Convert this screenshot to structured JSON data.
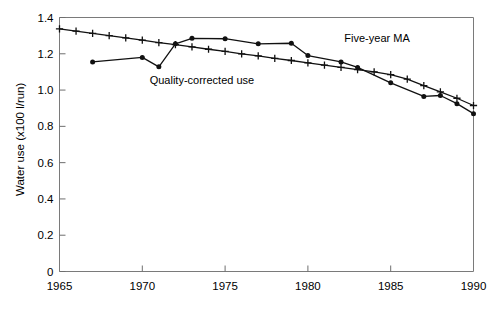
{
  "chart_data": {
    "type": "line",
    "title": "",
    "xlabel": "",
    "ylabel": "Water use (x100 l/run)",
    "xlim": [
      1965,
      1990
    ],
    "ylim": [
      0,
      1.4
    ],
    "grid": false,
    "legend_position": "inline-annotations",
    "x_ticks": [
      "1965",
      "1970",
      "1975",
      "1980",
      "1985",
      "1990"
    ],
    "x_tick_values": [
      1965,
      1970,
      1975,
      1980,
      1985,
      1990
    ],
    "y_ticks": [
      "0",
      "0.2",
      "0.4",
      "0.6",
      "0.8",
      "1.0",
      "1.2",
      "1.4"
    ],
    "y_tick_values": [
      0,
      0.2,
      0.4,
      0.6,
      0.8,
      1.0,
      1.2,
      1.4
    ],
    "annotations": [
      {
        "text": "Five-year MA",
        "x": 1982.2,
        "y": 1.265
      },
      {
        "text": "Quality-corrected use",
        "x": 1973.6,
        "y": 1.035
      }
    ],
    "series": [
      {
        "name": "Five-year MA",
        "marker": "filled-circle",
        "x": [
          1967,
          1970,
          1971,
          1972,
          1973,
          1975,
          1977,
          1979,
          1980,
          1982,
          1983,
          1985,
          1987,
          1988,
          1989,
          1990
        ],
        "values": [
          1.155,
          1.18,
          1.128,
          1.255,
          1.285,
          1.283,
          1.255,
          1.258,
          1.19,
          1.155,
          1.125,
          1.04,
          0.965,
          0.97,
          0.925,
          0.87
        ]
      },
      {
        "name": "Quality-corrected use",
        "marker": "plus",
        "x": [
          1965,
          1966,
          1967,
          1968,
          1969,
          1970,
          1971,
          1972,
          1973,
          1974,
          1975,
          1976,
          1977,
          1978,
          1979,
          1980,
          1981,
          1982,
          1983,
          1984,
          1985,
          1986,
          1987,
          1988,
          1989,
          1990
        ],
        "values": [
          1.337,
          1.325,
          1.313,
          1.3,
          1.288,
          1.275,
          1.262,
          1.25,
          1.238,
          1.225,
          1.213,
          1.2,
          1.188,
          1.175,
          1.163,
          1.15,
          1.138,
          1.125,
          1.113,
          1.1,
          1.085,
          1.06,
          1.025,
          0.99,
          0.955,
          0.915
        ]
      }
    ]
  }
}
